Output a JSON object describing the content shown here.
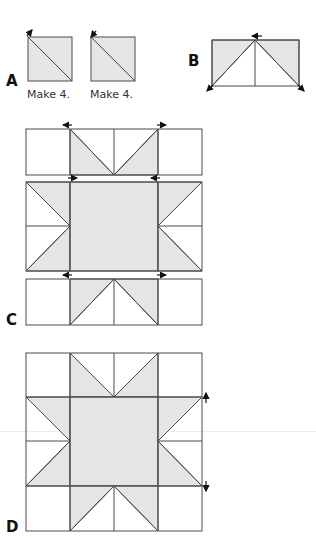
{
  "colors": {
    "fill": "#e5e5e5",
    "line": "#4a4a4a",
    "arrow": "#111111"
  },
  "steps": {
    "a": {
      "label": "A",
      "captions": [
        "Make 4.",
        "Make 4."
      ]
    },
    "b": {
      "label": "B"
    },
    "c": {
      "label": "C"
    },
    "d": {
      "label": "D"
    }
  }
}
